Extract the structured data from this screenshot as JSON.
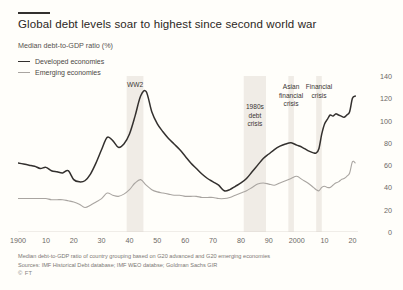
{
  "header": {
    "title": "Global debt levels soar to highest since second world war",
    "subtitle": "Median debt-to-GDP ratio (%)"
  },
  "footer": {
    "note": "Median debt-to-GDP ratio of country grouping based on G20 advanced and G20 emerging economies",
    "sources": "Sources: IMF Historical Debt database; IMF WEO databse; Goldman Sachs GIR",
    "brand": "© FT"
  },
  "chart_data": {
    "type": "line",
    "title": "Global debt levels soar to highest since second world war",
    "subtitle": "Median debt-to-GDP ratio (%)",
    "xlabel": "",
    "ylabel": "Median debt-to-GDP ratio (%)",
    "xlim": [
      1900,
      2022
    ],
    "ylim": [
      0,
      140
    ],
    "yticks": [
      0,
      20,
      40,
      60,
      80,
      100,
      120,
      140
    ],
    "xticks": [
      1900,
      1910,
      1920,
      1930,
      1940,
      1950,
      1960,
      1970,
      1980,
      1990,
      2000,
      2010,
      2020
    ],
    "xticklabels": [
      "1900",
      "10",
      "20",
      "30",
      "40",
      "50",
      "60",
      "70",
      "80",
      "90",
      "2000",
      "10",
      "20"
    ],
    "grid": false,
    "legend_position": "top-left",
    "colors": {
      "developed": "#33302e",
      "emerging": "#a9a5a1",
      "band": "#f0ece6",
      "axis": "#d8d4cd"
    },
    "shaded_bands": [
      {
        "label": "WW2",
        "x0": 1939,
        "x1": 1945
      },
      {
        "label": "1980s debt crisis",
        "x0": 1981,
        "x1": 1989
      },
      {
        "label": "Asian financial crisis",
        "x0": 1997,
        "x1": 1999
      },
      {
        "label": "Financial crisis",
        "x0": 2007,
        "x1": 2009
      }
    ],
    "annotations": [
      {
        "text": "WW2",
        "x": 1942,
        "y": 132
      },
      {
        "text": "1980s\ndebt\ncrisis",
        "x": 1985,
        "y": 112
      },
      {
        "text": "Asian\nfinancial\ncrisis",
        "x": 1998,
        "y": 130
      },
      {
        "text": "Financial\ncrisis",
        "x": 2008,
        "y": 130
      }
    ],
    "x": [
      1900,
      1902,
      1904,
      1906,
      1908,
      1910,
      1912,
      1914,
      1916,
      1918,
      1920,
      1922,
      1924,
      1926,
      1928,
      1930,
      1932,
      1934,
      1936,
      1938,
      1940,
      1942,
      1944,
      1946,
      1948,
      1950,
      1952,
      1954,
      1956,
      1958,
      1960,
      1962,
      1964,
      1966,
      1968,
      1970,
      1972,
      1974,
      1976,
      1978,
      1980,
      1982,
      1984,
      1986,
      1988,
      1990,
      1992,
      1994,
      1996,
      1998,
      2000,
      2002,
      2004,
      2006,
      2007,
      2008,
      2009,
      2010,
      2011,
      2012,
      2013,
      2014,
      2015,
      2016,
      2017,
      2018,
      2019,
      2020,
      2021
    ],
    "series": [
      {
        "name": "Developed economies",
        "color": "#33302e",
        "values": [
          62,
          61,
          60,
          59,
          57,
          58,
          55,
          54,
          53,
          55,
          47,
          45,
          46,
          52,
          62,
          74,
          85,
          82,
          76,
          79,
          88,
          104,
          122,
          126,
          108,
          97,
          90,
          84,
          79,
          74,
          68,
          62,
          57,
          52,
          48,
          45,
          42,
          37,
          38,
          41,
          44,
          48,
          54,
          60,
          66,
          70,
          74,
          77,
          79,
          80,
          78,
          76,
          73,
          71,
          71,
          75,
          88,
          97,
          101,
          105,
          104,
          106,
          105,
          104,
          103,
          105,
          108,
          120,
          122
        ]
      },
      {
        "name": "Emerging economies",
        "color": "#a9a5a1",
        "values": [
          30,
          30,
          30,
          30,
          30,
          30,
          29,
          29,
          29,
          28,
          27,
          25,
          22,
          24,
          27,
          30,
          35,
          33,
          32,
          34,
          38,
          44,
          47,
          42,
          38,
          36,
          35,
          34,
          33,
          33,
          32,
          32,
          32,
          31,
          31,
          31,
          30,
          30,
          31,
          33,
          35,
          37,
          40,
          43,
          44,
          43,
          42,
          44,
          46,
          48,
          50,
          47,
          44,
          40,
          38,
          37,
          40,
          41,
          40,
          40,
          42,
          44,
          45,
          47,
          48,
          50,
          53,
          63,
          62
        ]
      }
    ]
  }
}
